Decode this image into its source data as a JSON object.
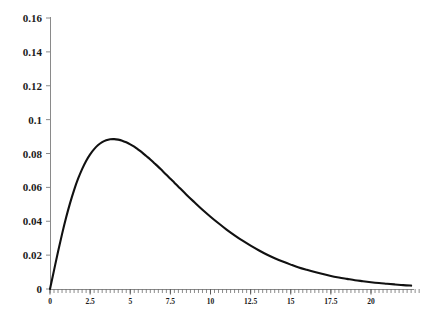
{
  "chart_data": {
    "type": "line",
    "title": "",
    "subtitle": "",
    "xlabel": "",
    "ylabel": "",
    "xlim": [
      0,
      23.2
    ],
    "ylim": [
      0,
      0.16
    ],
    "grid": false,
    "legend": null,
    "legend_position": "none",
    "line_color": "#111111",
    "axis_color": "#808080",
    "background_color": "#ffffff",
    "x_ticks": [
      0,
      2.5,
      5,
      7.5,
      10,
      12.5,
      15,
      17.5,
      20
    ],
    "x_tick_labels": [
      "0",
      "2.5",
      "5",
      "7.5",
      "10",
      "12.5",
      "15",
      "17.5",
      "20"
    ],
    "y_ticks": [
      0,
      0.02,
      0.04,
      0.06,
      0.08,
      0.1,
      0.12,
      0.14,
      0.16
    ],
    "y_tick_labels": [
      "0",
      "0.02",
      "0.04",
      "0.06",
      "0.08",
      "0.1",
      "0.12",
      "0.14",
      "0.16"
    ],
    "minor_ticks_x": true,
    "minor_tick_interval_x": 0.25,
    "annotations": [],
    "series": [
      {
        "name": "density",
        "x": [
          0,
          0.25,
          0.5,
          0.75,
          1,
          1.25,
          1.5,
          1.75,
          2,
          2.25,
          2.5,
          2.75,
          3,
          3.25,
          3.5,
          3.75,
          4,
          4.25,
          4.5,
          4.75,
          5,
          5.25,
          5.5,
          5.75,
          6,
          6.25,
          6.5,
          6.75,
          7,
          7.25,
          7.5,
          7.75,
          8,
          8.5,
          9,
          9.5,
          10,
          10.5,
          11,
          11.5,
          12,
          12.5,
          13,
          13.5,
          14,
          14.5,
          15,
          15.5,
          16,
          16.5,
          17,
          17.5,
          18,
          18.5,
          19,
          19.5,
          20,
          20.5,
          21,
          21.5,
          22,
          22.5,
          23.2
        ],
        "y": [
          0,
          0.011,
          0.022,
          0.0324,
          0.042,
          0.0507,
          0.0584,
          0.0651,
          0.0708,
          0.0756,
          0.0795,
          0.0826,
          0.085,
          0.0867,
          0.0878,
          0.0884,
          0.0885,
          0.0882,
          0.0876,
          0.0866,
          0.0854,
          0.084,
          0.0823,
          0.0805,
          0.0785,
          0.0765,
          0.0743,
          0.0721,
          0.0698,
          0.0675,
          0.0651,
          0.0628,
          0.0604,
          0.0557,
          0.0512,
          0.0468,
          0.0427,
          0.0388,
          0.0351,
          0.0317,
          0.0285,
          0.0256,
          0.0229,
          0.0204,
          0.0182,
          0.0162,
          0.0144,
          0.0127,
          0.0113,
          0.01,
          0.0088,
          0.0077,
          0.0068,
          0.006,
          0.0052,
          0.0046,
          0.004,
          0.0035,
          0.0031,
          0.0027,
          0.0023,
          0.002,
          0.0017
        ]
      }
    ],
    "peak": {
      "x": 3.74,
      "y": 0.135
    },
    "distribution_note": "unimodal right-skewed density curve"
  },
  "axes": {
    "origin_label": "0",
    "y_axis_top_value": "0.16",
    "x_axis_max_label": "20"
  }
}
